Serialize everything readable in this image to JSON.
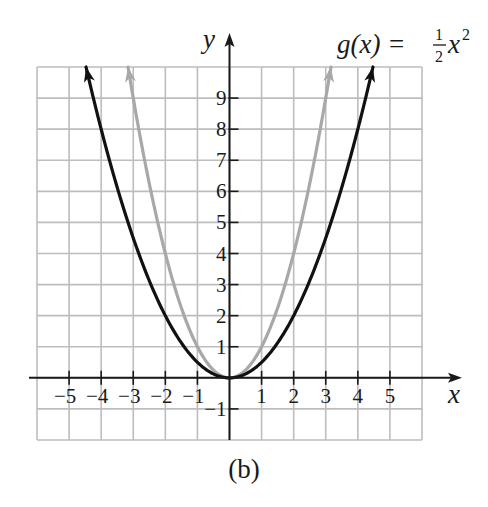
{
  "figure": {
    "caption": "(b)",
    "function_label": {
      "lhs": "g(x) =",
      "num": "1",
      "den": "2",
      "var": "x",
      "exp": "2"
    },
    "x_axis_label": "x",
    "y_axis_label": "y"
  },
  "colors": {
    "grid": "#bdbdbd",
    "axis": "#1a1a1a",
    "g_curve": "#111111",
    "f_curve": "#a8a8a8",
    "background": "#ffffff"
  },
  "chart_data": {
    "type": "line",
    "xlabel": "x",
    "ylabel": "y",
    "xlim": [
      -6,
      6
    ],
    "ylim": [
      -2,
      10
    ],
    "grid": true,
    "x_ticks": [
      -5,
      -4,
      -3,
      -2,
      -1,
      1,
      2,
      3,
      4,
      5
    ],
    "x_tick_labels": [
      "−5",
      "−4",
      "−3",
      "−2",
      "−1",
      "1",
      "2",
      "3",
      "4",
      "5"
    ],
    "y_ticks": [
      -1,
      1,
      2,
      3,
      4,
      5,
      6,
      7,
      8,
      9
    ],
    "y_tick_labels": [
      "−1",
      "1",
      "2",
      "3",
      "4",
      "5",
      "6",
      "7",
      "8",
      "9"
    ],
    "series": [
      {
        "name": "g(x) = (1/2)x^2",
        "color": "#111111",
        "coef": 0.5,
        "x": [
          -4.47,
          -4,
          -3,
          -2,
          -1,
          0,
          1,
          2,
          3,
          4,
          4.47
        ],
        "y": [
          10,
          8,
          4.5,
          2,
          0.5,
          0,
          0.5,
          2,
          4.5,
          8,
          10
        ]
      },
      {
        "name": "f(x) = x^2",
        "color": "#a8a8a8",
        "coef": 1,
        "x": [
          -3.16,
          -3,
          -2,
          -1,
          0,
          1,
          2,
          3,
          3.16
        ],
        "y": [
          10,
          9,
          4,
          1,
          0,
          1,
          4,
          9,
          10
        ]
      }
    ],
    "annotations": [
      "g(x) = 1/2 x^2",
      "(b)"
    ]
  }
}
